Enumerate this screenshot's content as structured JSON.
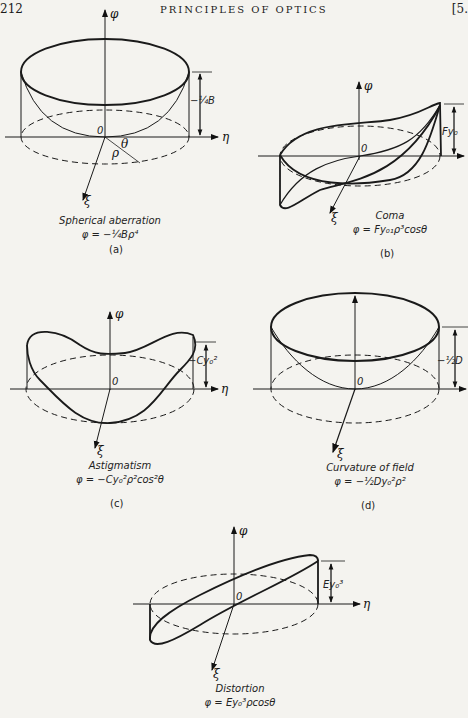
{
  "header": {
    "page_number": "212",
    "running_title": "PRINCIPLES OF OPTICS",
    "section_mark": "[5."
  },
  "axes": {
    "phi": "φ",
    "eta": "η",
    "xi": "ξ",
    "origin": "0",
    "rho": "ρ",
    "theta": "θ"
  },
  "figures": [
    {
      "id": "a",
      "title": "Spherical aberration",
      "formula": "φ = −¼Bρ⁴",
      "label": "(a)",
      "height_label": "−¼B"
    },
    {
      "id": "b",
      "title": "Coma",
      "formula": "φ = Fy₀₁ρ³cosθ",
      "label": "(b)",
      "height_label": "Fy₀"
    },
    {
      "id": "c",
      "title": "Astigmatism",
      "formula": "φ = −Cy₀²ρ²cos²θ",
      "label": "(c)",
      "height_label": "−Cy₀²"
    },
    {
      "id": "d",
      "title": "Curvature of field",
      "formula": "φ = −½Dy₀²ρ²",
      "label": "(d)",
      "height_label": "−½D"
    },
    {
      "id": "e",
      "title": "Distortion",
      "formula": "φ = Ey₀³ρcosθ",
      "label": "",
      "height_label": "Ey₀³"
    }
  ]
}
